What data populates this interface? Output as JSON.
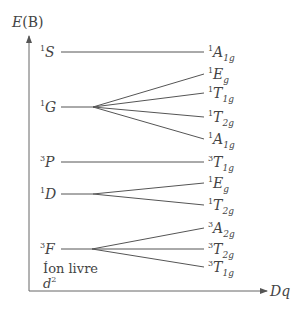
{
  "axes": {
    "y_label": "E(B)",
    "y_label_italic": "E",
    "y_label_paren": "(B)",
    "x_label": "Dq"
  },
  "free_ion": {
    "line1": "Íon livre",
    "line2_base": "d",
    "line2_sup": "2"
  },
  "terms": [
    {
      "sup": "1",
      "sym": "S",
      "y": 52,
      "split_x": null,
      "states": [
        {
          "sup": "1",
          "sym": "A",
          "sub": "1g",
          "y": 52
        }
      ]
    },
    {
      "sup": "1",
      "sym": "G",
      "y": 107,
      "split_x": 93,
      "states": [
        {
          "sup": "1",
          "sym": "E",
          "sub": "g",
          "y": 74
        },
        {
          "sup": "1",
          "sym": "T",
          "sub": "1g",
          "y": 93
        },
        {
          "sup": "1",
          "sym": "T",
          "sub": "2g",
          "y": 117
        },
        {
          "sup": "1",
          "sym": "A",
          "sub": "1g",
          "y": 139
        }
      ]
    },
    {
      "sup": "3",
      "sym": "P",
      "y": 162,
      "split_x": null,
      "states": [
        {
          "sup": "3",
          "sym": "T",
          "sub": "1g",
          "y": 162
        }
      ]
    },
    {
      "sup": "1",
      "sym": "D",
      "y": 194,
      "split_x": 93,
      "states": [
        {
          "sup": "1",
          "sym": "E",
          "sub": "g",
          "y": 183
        },
        {
          "sup": "1",
          "sym": "T",
          "sub": "2g",
          "y": 205
        }
      ]
    },
    {
      "sup": "3",
      "sym": "F",
      "y": 249,
      "split_x": 92,
      "states": [
        {
          "sup": "3",
          "sym": "A",
          "sub": "2g",
          "y": 228
        },
        {
          "sup": "3",
          "sym": "T",
          "sub": "2g",
          "y": 249
        },
        {
          "sup": "3",
          "sym": "T",
          "sub": "1g",
          "y": 267
        }
      ]
    }
  ],
  "colors": {
    "line": "#555555",
    "text": "#444444"
  }
}
